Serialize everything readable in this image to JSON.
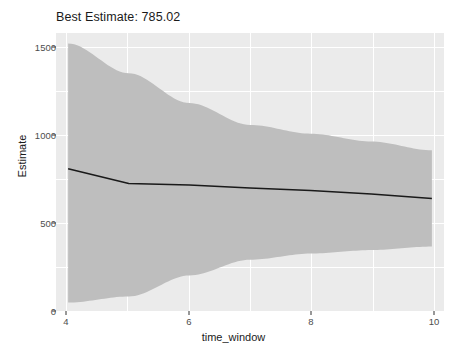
{
  "chart_data": {
    "type": "line",
    "title": "Best Estimate: 785.02",
    "xlabel": "time_window",
    "ylabel": "Estimate",
    "xlim": [
      3.8,
      10.2
    ],
    "ylim": [
      -28,
      1560
    ],
    "grid": true,
    "legend": "none",
    "x_ticks": [
      4,
      6,
      8,
      10
    ],
    "x_tick_labels": [
      "4",
      "6",
      "8",
      "10"
    ],
    "y_ticks": [
      0,
      500,
      1000,
      1500
    ],
    "y_tick_labels": [
      "0",
      "500",
      "1000",
      "1500"
    ],
    "x": [
      4,
      5,
      6,
      7,
      8,
      9,
      10
    ],
    "series": [
      {
        "name": "Estimate",
        "type": "line",
        "color": "#1a1a1a",
        "values": [
          785.02,
          700,
          692,
          675,
          660,
          640,
          615
        ]
      },
      {
        "name": "Confidence band",
        "type": "ribbon",
        "color": "#bebebe",
        "upper": [
          1500,
          1330,
          1160,
          1035,
          985,
          940,
          890
        ],
        "lower": [
          20,
          55,
          175,
          265,
          300,
          320,
          340
        ]
      }
    ],
    "annotations": [
      {
        "label": "Best Estimate",
        "value": 785.02
      }
    ]
  }
}
